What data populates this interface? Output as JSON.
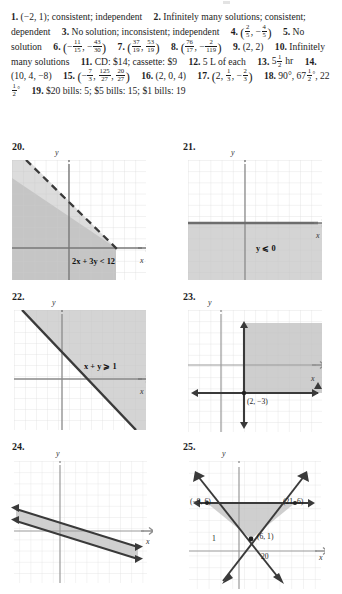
{
  "page": {
    "type": "textbook-answer-key",
    "accent": "#808080",
    "shade_fill": "#c8c8c8",
    "grid_color": "#d9d9d9",
    "axis_color": "#777777",
    "line_color": "#3a3a3a"
  },
  "answers": [
    {
      "num": "1.",
      "text": "(−2, 1); consistent; independent"
    },
    {
      "num": "2.",
      "text": "Infinitely many solutions; consistent; dependent"
    },
    {
      "num": "3.",
      "text": "No solution; inconsistent; independent"
    },
    {
      "num": "4.",
      "text": "(2/5, −4/5)",
      "frac": [
        [
          "2",
          "5"
        ],
        [
          "4",
          "5"
        ]
      ]
    },
    {
      "num": "5.",
      "text": "No solution"
    },
    {
      "num": "6.",
      "text": "(−11/15, −43/30)",
      "frac": [
        [
          "11",
          "15"
        ],
        [
          "43",
          "30"
        ]
      ]
    },
    {
      "num": "7.",
      "text": "(37/19, 53/19)",
      "frac": [
        [
          "37",
          "19"
        ],
        [
          "53",
          "19"
        ]
      ]
    },
    {
      "num": "8.",
      "text": "(76/17, −2/119)",
      "frac": [
        [
          "76",
          "17"
        ],
        [
          "2",
          "119"
        ]
      ]
    },
    {
      "num": "9.",
      "text": "(2, 2)"
    },
    {
      "num": "10.",
      "text": "Infinitely many solutions"
    },
    {
      "num": "11.",
      "text": "CD: $14; cassette: $9"
    },
    {
      "num": "12.",
      "text": "5 L of each"
    },
    {
      "num": "13.",
      "text": "5 1/2 hr",
      "frac": [
        [
          "1",
          "2"
        ]
      ]
    },
    {
      "num": "14.",
      "text": "(10, 4, −8)"
    },
    {
      "num": "15.",
      "text": "(−7/3, 125/27, 20/27)",
      "frac": [
        [
          "7",
          "3"
        ],
        [
          "125",
          "27"
        ],
        [
          "20",
          "27"
        ]
      ]
    },
    {
      "num": "16.",
      "text": "(2, 0, 4)"
    },
    {
      "num": "17.",
      "text": "(2, 1/3, −2/3)",
      "frac": [
        [
          "1",
          "3"
        ],
        [
          "2",
          "3"
        ]
      ]
    },
    {
      "num": "18.",
      "text": "90°, 67 1/2 °, 22 1/2 °",
      "frac": [
        [
          "1",
          "2"
        ],
        [
          "1",
          "2"
        ]
      ]
    },
    {
      "num": "19.",
      "text": "$20 bills: 5; $5 bills: 15; $1 bills: 19"
    }
  ],
  "graphs": [
    {
      "number": "20.",
      "inequality": "2x + 3y < 12",
      "boundary_style": "dashed",
      "shading": "below-left",
      "x_axis_label": "x",
      "y_axis_label": "y",
      "grid": true
    },
    {
      "number": "21.",
      "inequality": "y ⩽ 0",
      "boundary_style": "solid",
      "shading": "below-x-axis",
      "x_axis_label": "x",
      "y_axis_label": "y",
      "grid": true
    },
    {
      "number": "22.",
      "inequality": "x + y ⩾ 1",
      "boundary_style": "solid",
      "shading": "above-right",
      "x_axis_label": "x",
      "y_axis_label": "y",
      "grid": true
    },
    {
      "number": "23.",
      "inequality": "",
      "boundary_style": "solid",
      "shading": "corner-region",
      "point_label": "(2, −3)",
      "x_axis_label": "x",
      "y_axis_label": "y",
      "grid": true
    },
    {
      "number": "24.",
      "inequality": "",
      "boundary_style": "solid",
      "shading": "band",
      "x_axis_label": "x",
      "y_axis_label": "y",
      "grid": true
    },
    {
      "number": "25.",
      "inequality": "",
      "boundary_style": "solid",
      "shading": "triangle",
      "vertex_labels": [
        "(−9, 6)",
        "(21, 6)",
        "(6, 1)"
      ],
      "scale_labels": {
        "y": "1",
        "x": "20"
      },
      "x_axis_label": "x",
      "y_axis_label": "y",
      "grid": true
    }
  ]
}
